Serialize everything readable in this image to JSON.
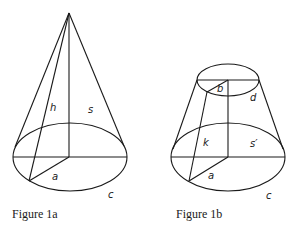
{
  "figures": [
    {
      "id": "1a",
      "caption": "Figure 1a",
      "shape": "cone",
      "labels": {
        "height": "h",
        "slant": "s",
        "radius": "a",
        "circumference": "c"
      }
    },
    {
      "id": "1b",
      "caption": "Figure 1b",
      "shape": "frustum",
      "labels": {
        "top_radius": "b",
        "top_circumference": "d",
        "slant_height": "k",
        "slant": "s′",
        "bottom_radius": "a",
        "bottom_circumference": "c"
      }
    }
  ],
  "colors": {
    "line": "#1a1a1a",
    "background": "#ffffff"
  }
}
